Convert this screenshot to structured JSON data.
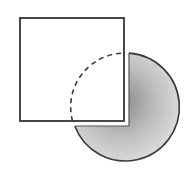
{
  "diagram": {
    "colors": {
      "background": "#ffffff",
      "stroke": "#3a3a3a",
      "shade_dark": "#9a9a9a",
      "shade_light": "#f2f2f2"
    },
    "square": {
      "x": 20,
      "y": 18,
      "size": 104
    },
    "circle": {
      "cx": 126,
      "cy": 107,
      "r": 54
    },
    "gap": 5
  }
}
